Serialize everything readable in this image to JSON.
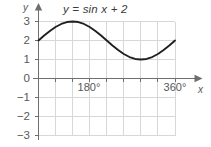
{
  "chart_data": {
    "type": "line",
    "title": "y = sin x + 2",
    "xlabel": "x",
    "ylabel": "y",
    "equation": "y = sin x + 2",
    "grid": true,
    "legend": "none",
    "xlim": [
      0,
      360
    ],
    "ylim": [
      -3,
      3
    ],
    "x_unit": "degrees",
    "x_tick_labels": [
      "180°",
      "360°"
    ],
    "x_tick_values": [
      180,
      360
    ],
    "x_gridline_values": [
      0,
      45,
      90,
      135,
      180,
      225,
      270,
      315,
      360
    ],
    "y_tick_labels": [
      "3",
      "2",
      "1",
      "0",
      "−1",
      "−2",
      "−3"
    ],
    "y_tick_values": [
      3,
      2,
      1,
      0,
      -1,
      -2,
      -3
    ],
    "curve_color": "#231f20",
    "grid_color": "#d7d7d9",
    "axis_color": "#6d6e71",
    "series": [
      {
        "name": "y = sin x + 2",
        "x": [
          0,
          15,
          30,
          45,
          60,
          75,
          90,
          105,
          120,
          135,
          150,
          165,
          180,
          195,
          210,
          225,
          240,
          255,
          270,
          285,
          300,
          315,
          330,
          345,
          360
        ],
        "values": [
          2,
          2.26,
          2.5,
          2.71,
          2.87,
          2.97,
          3,
          2.97,
          2.87,
          2.71,
          2.5,
          2.26,
          2,
          1.74,
          1.5,
          1.29,
          1.13,
          1.03,
          1,
          1.03,
          1.13,
          1.29,
          1.5,
          1.74,
          2
        ]
      }
    ],
    "key_points": {
      "start": {
        "x": 0,
        "y": 2
      },
      "maximum": {
        "x": 90,
        "y": 3
      },
      "midpoint": {
        "x": 180,
        "y": 2
      },
      "minimum": {
        "x": 270,
        "y": 1
      },
      "end": {
        "x": 360,
        "y": 2
      }
    }
  },
  "axes": {
    "y_axis_label": "y",
    "x_axis_label": "x"
  }
}
